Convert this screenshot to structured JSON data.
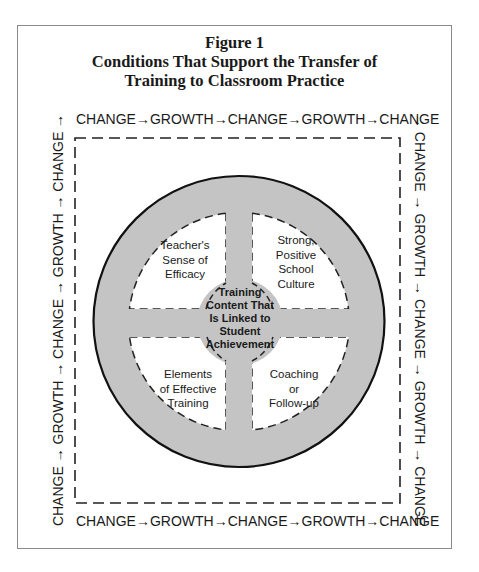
{
  "figure": {
    "label": "Figure 1",
    "title_lines": [
      "Conditions That Support the Transfer of",
      "Training to Classroom Practice"
    ]
  },
  "cycle": {
    "top": "CHANGE→GROWTH→CHANGE→GROWTH→CHANGE",
    "bottom": "CHANGE→GROWTH→CHANGE→GROWTH→CHANGE",
    "left": "CHANGE → GROWTH → CHANGE → GROWTH → CHANGE →",
    "right": "→ CHANGE → GROWTH → CHANGE → GROWTH → CHANGE"
  },
  "wheel": {
    "center": {
      "lines": [
        "Training",
        "Content That",
        "Is Linked to",
        "Student",
        "Achievement"
      ]
    },
    "quadrants": {
      "top_left": {
        "lines": [
          "Teacher's",
          "Sense of",
          "Efficacy"
        ]
      },
      "top_right": {
        "lines": [
          "Strong,",
          "Positive",
          "School",
          "Culture"
        ]
      },
      "bottom_left": {
        "lines": [
          "Elements",
          "of Effective",
          "Training"
        ]
      },
      "bottom_right": {
        "lines": [
          "Coaching",
          "or",
          "Follow-up"
        ]
      }
    },
    "colors": {
      "wheel_fill": "#c4c4c4",
      "quadrant_fill": "#ffffff",
      "outline": "#111111"
    }
  }
}
